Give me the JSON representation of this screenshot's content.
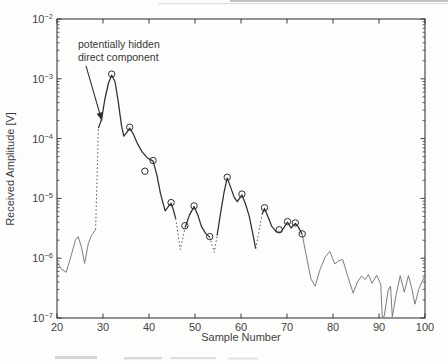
{
  "chart_data": {
    "type": "line",
    "title": "",
    "xlabel": "Sample Number",
    "ylabel": "Received Amplitude [V]",
    "xlim": [
      20,
      100
    ],
    "y_scale": "log",
    "ylim": [
      1e-07,
      0.01
    ],
    "x_ticks": [
      20,
      30,
      40,
      50,
      60,
      70,
      80,
      90,
      100
    ],
    "y_tick_exponents": [
      -2,
      -3,
      -4,
      -5,
      -6,
      -7
    ],
    "grid": false,
    "legend": "none",
    "line_color": "#2f2f2f",
    "series_segments": [
      {
        "style": "light",
        "points": [
          [
            20,
            8.5e-07
          ],
          [
            21,
            6.5e-07
          ],
          [
            22,
            5.8e-07
          ],
          [
            23,
            1.05e-06
          ],
          [
            24,
            2e-06
          ],
          [
            24.6,
            2.3e-06
          ],
          [
            25.3,
            1.55e-06
          ],
          [
            26,
            8.2e-07
          ],
          [
            26.8,
            1.75e-06
          ],
          [
            27.5,
            2.4e-06
          ],
          [
            28.4,
            3e-06
          ]
        ]
      },
      {
        "style": "dotted",
        "points": [
          [
            28.4,
            3e-06
          ],
          [
            29.0,
            0.00015
          ]
        ]
      },
      {
        "style": "main",
        "points": [
          [
            29.0,
            0.00015
          ],
          [
            29.7,
            0.00021
          ],
          [
            30.4,
            0.00045
          ],
          [
            31.2,
            0.00085
          ],
          [
            31.9,
            0.00115
          ],
          [
            32.6,
            0.0009
          ],
          [
            33.3,
            0.00042
          ],
          [
            34.0,
            0.00017
          ],
          [
            34.5,
            0.00011
          ],
          [
            35.1,
            0.000125
          ],
          [
            35.8,
            0.00015
          ],
          [
            36.6,
            0.000118
          ],
          [
            37.5,
            8.2e-05
          ],
          [
            38.5,
            6e-05
          ],
          [
            39.6,
            4.8e-05
          ],
          [
            40.9,
            4.2e-05
          ],
          [
            41.7,
            2.5e-05
          ],
          [
            42.5,
            1.2e-05
          ],
          [
            43.5,
            6.2e-06
          ],
          [
            44.2,
            7.3e-06
          ],
          [
            44.8,
            8.3e-06
          ],
          [
            45.3,
            6.4e-06
          ],
          [
            45.8,
            4.6e-06
          ]
        ]
      },
      {
        "style": "dotted",
        "points": [
          [
            45.8,
            4.6e-06
          ],
          [
            46.8,
            1.4e-06
          ],
          [
            47.9,
            3.3e-06
          ]
        ]
      },
      {
        "style": "main",
        "points": [
          [
            47.9,
            3.3e-06
          ],
          [
            48.8,
            5.3e-06
          ],
          [
            49.8,
            7.3e-06
          ],
          [
            50.6,
            5.3e-06
          ],
          [
            51.4,
            3.4e-06
          ],
          [
            52.3,
            2.6e-06
          ],
          [
            53.2,
            2.25e-06
          ]
        ]
      },
      {
        "style": "dotted",
        "points": [
          [
            53.2,
            2.25e-06
          ],
          [
            54.2,
            1.25e-06
          ],
          [
            54.8,
            2.4e-06
          ]
        ]
      },
      {
        "style": "main",
        "points": [
          [
            54.8,
            2.4e-06
          ],
          [
            55.6,
            6e-06
          ],
          [
            56.3,
            1.25e-05
          ],
          [
            57.0,
            2.2e-05
          ],
          [
            57.8,
            1.5e-05
          ],
          [
            58.5,
            1.05e-05
          ],
          [
            59.2,
            8.8e-06
          ],
          [
            60.2,
            1.15e-05
          ],
          [
            61.0,
            8e-06
          ],
          [
            61.8,
            5e-06
          ],
          [
            62.5,
            2.7e-06
          ],
          [
            63.2,
            1.45e-06
          ]
        ]
      },
      {
        "style": "dotted",
        "points": [
          [
            63.2,
            1.45e-06
          ],
          [
            64.6,
            5.5e-06
          ]
        ]
      },
      {
        "style": "main",
        "points": [
          [
            64.6,
            5.5e-06
          ],
          [
            65.1,
            6.8e-06
          ],
          [
            65.9,
            4.9e-06
          ],
          [
            66.7,
            3.4e-06
          ],
          [
            67.7,
            2.75e-06
          ],
          [
            68.6,
            2.7e-06
          ],
          [
            69.4,
            3.3e-06
          ],
          [
            70.1,
            4e-06
          ],
          [
            70.9,
            3.2e-06
          ],
          [
            71.8,
            3.8e-06
          ],
          [
            72.5,
            3.3e-06
          ],
          [
            73.3,
            2.5e-06
          ]
        ]
      },
      {
        "style": "light",
        "points": [
          [
            73.3,
            2.5e-06
          ],
          [
            74.2,
            1.1e-06
          ],
          [
            75.2,
            4.5e-07
          ],
          [
            76.1,
            3.4e-07
          ],
          [
            77.2,
            6.5e-07
          ],
          [
            78.3,
            1.05e-06
          ],
          [
            79.3,
            1.3e-06
          ],
          [
            80.4,
            8e-07
          ],
          [
            81.2,
            9e-07
          ],
          [
            82.1,
            9.5e-07
          ],
          [
            83.2,
            5e-07
          ],
          [
            84.4,
            2.6e-07
          ],
          [
            85.3,
            4e-07
          ],
          [
            86.2,
            5e-07
          ],
          [
            87.0,
            4.4e-07
          ],
          [
            87.7,
            5.3e-07
          ],
          [
            88.5,
            3.8e-07
          ],
          [
            89.5,
            5.2e-07
          ],
          [
            90.4,
            3.6e-07
          ],
          [
            90.7,
            1.05e-07
          ],
          [
            91.1,
            1.05e-07
          ],
          [
            92.0,
            2.9e-07
          ],
          [
            92.5,
            3.4e-07
          ],
          [
            92.9,
            1.05e-07
          ],
          [
            93.7,
            2.4e-07
          ],
          [
            94.6,
            5.1e-07
          ],
          [
            95.5,
            2.7e-07
          ],
          [
            96.4,
            5.1e-07
          ],
          [
            97.1,
            3.2e-07
          ],
          [
            97.8,
            1.7e-07
          ],
          [
            98.7,
            3.1e-07
          ],
          [
            99.4,
            4.1e-07
          ],
          [
            100,
            5.1e-07
          ]
        ]
      }
    ],
    "circle_markers": [
      [
        31.9,
        0.0012
      ],
      [
        35.8,
        0.000155
      ],
      [
        39.1,
        2.85e-05
      ],
      [
        40.9,
        4.3e-05
      ],
      [
        44.8,
        8.5e-06
      ],
      [
        47.8,
        3.5e-06
      ],
      [
        49.8,
        7.5e-06
      ],
      [
        53.2,
        2.3e-06
      ],
      [
        57.0,
        2.25e-05
      ],
      [
        60.2,
        1.18e-05
      ],
      [
        65.1,
        7e-06
      ],
      [
        68.3,
        3e-06
      ],
      [
        70.1,
        4.1e-06
      ],
      [
        71.8,
        3.9e-06
      ],
      [
        73.3,
        2.55e-06
      ]
    ],
    "annotation": {
      "line1": "potentially hidden",
      "line2": "direct component",
      "arrow_tail": [
        26.3,
        0.00165
      ],
      "arrow_head": [
        29.75,
        0.0002
      ]
    }
  }
}
